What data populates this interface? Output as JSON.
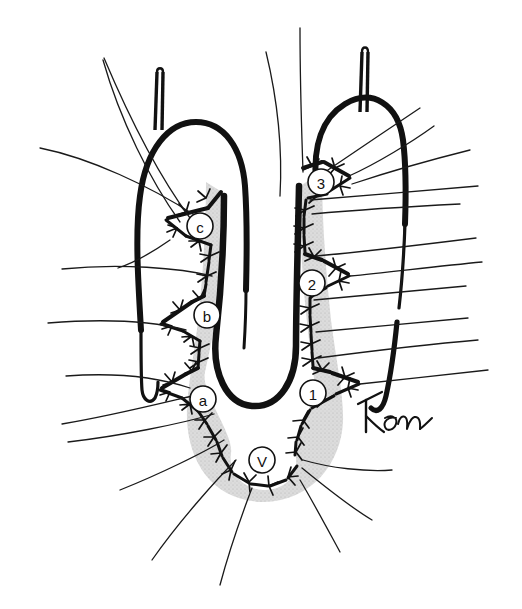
{
  "figure": {
    "kind": "hand-drawn surgical anatomical illustration",
    "title": "",
    "background_color": "#ffffff",
    "ink_color": "#111111",
    "shading_color": "#d9d9d9",
    "shading_stipple_color": "#b5b5b5"
  },
  "labels": [
    {
      "id": "label-c",
      "text": "c",
      "x": 200,
      "y": 226,
      "r": 13
    },
    {
      "id": "label-b",
      "text": "b",
      "x": 207,
      "y": 315,
      "r": 13
    },
    {
      "id": "label-a",
      "text": "a",
      "x": 203,
      "y": 399,
      "r": 13
    },
    {
      "id": "label-v",
      "text": "V",
      "x": 262,
      "y": 460,
      "r": 13
    },
    {
      "id": "label-1",
      "text": "1",
      "x": 313,
      "y": 393,
      "r": 13
    },
    {
      "id": "label-2",
      "text": "2",
      "x": 312,
      "y": 283,
      "r": 13
    },
    {
      "id": "label-3",
      "text": "3",
      "x": 321,
      "y": 182,
      "r": 13
    }
  ],
  "signature": {
    "text": "Ken",
    "x": 365,
    "y": 412,
    "width": 60,
    "height": 34
  },
  "structures": {
    "left_lobe_label": "left tubular structure",
    "right_lobe_label": "right tubular structure",
    "central_cleft_label": "central V-shaped cleft",
    "left_catheter_label": "left catheter tube",
    "right_catheter_label": "right catheter tube",
    "shaded_mucosa_label": "shaded mucosal flap region"
  },
  "suture_marks": {
    "name": "stitch-barb-marks",
    "count_description": "tick barbs along the zigzag staple lines"
  },
  "radiating_lines": {
    "name": "traction-suture-threads",
    "count_description": "thin threads radiating outward from the margins"
  }
}
